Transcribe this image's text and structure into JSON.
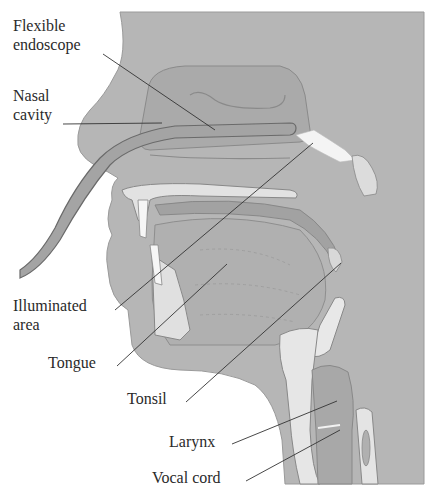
{
  "diagram": {
    "colors": {
      "background": "#ffffff",
      "tissue": "#b4b4b4",
      "tissue_dark": "#9c9c9c",
      "bone": "#e4e4e4",
      "illuminated": "#f4f4f4",
      "outline": "#7a7a7a",
      "leader_line": "#333333",
      "text": "#2a2a2a"
    },
    "labels": [
      {
        "id": "flexible-endoscope",
        "lines": [
          "Flexible",
          "endoscope"
        ]
      },
      {
        "id": "nasal-cavity",
        "lines": [
          "Nasal",
          "cavity"
        ]
      },
      {
        "id": "illuminated-area",
        "lines": [
          "Illuminated",
          "area"
        ]
      },
      {
        "id": "tongue",
        "lines": [
          "Tongue"
        ]
      },
      {
        "id": "tonsil",
        "lines": [
          "Tonsil"
        ]
      },
      {
        "id": "larynx",
        "lines": [
          "Larynx"
        ]
      },
      {
        "id": "vocal-cord",
        "lines": [
          "Vocal cord"
        ]
      }
    ]
  }
}
